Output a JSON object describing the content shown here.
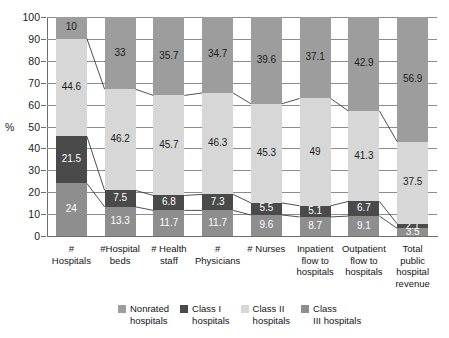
{
  "chart_data": {
    "type": "bar",
    "subtype": "stacked-100-percent",
    "title": "",
    "xlabel": "",
    "ylabel": "%",
    "ylim": [
      0,
      100
    ],
    "ytick_labels": [
      "0",
      "10",
      "20",
      "30",
      "40",
      "50",
      "60",
      "70",
      "80",
      "90",
      "100"
    ],
    "ytick_values": [
      0,
      10,
      20,
      30,
      40,
      50,
      60,
      70,
      80,
      90,
      100
    ],
    "grid": true,
    "legend_position": "bottom",
    "categories": [
      "# Hospitals",
      "#Hospital beds",
      "# Health staff",
      "# Physicians",
      "# Nurses",
      "Inpatient flow to hospitals",
      "Outpatient flow to hospitals",
      "Total public hospital revenue"
    ],
    "category_lines": [
      [
        "#",
        "Hospitals"
      ],
      [
        "#Hospital",
        "beds"
      ],
      [
        "# Health",
        "staff"
      ],
      [
        "#",
        "Physicians"
      ],
      [
        "# Nurses"
      ],
      [
        "Inpatient",
        "flow to",
        "hospitals"
      ],
      [
        "Outpatient",
        "flow to",
        "hospitals"
      ],
      [
        "Total",
        "public",
        "hospital",
        "revenue"
      ]
    ],
    "series": [
      {
        "name": "Class III hospitals",
        "color": "#8e8e8e",
        "label_color": "#ffffff",
        "values": [
          24,
          13.3,
          11.7,
          11.7,
          9.6,
          8.7,
          9.1,
          3.5
        ]
      },
      {
        "name": "Class I hospitals",
        "color": "#4a4a4a",
        "label_color": "#ffffff",
        "values": [
          21.5,
          7.5,
          6.8,
          7.3,
          5.5,
          5.1,
          6.7,
          2.1
        ]
      },
      {
        "name": "Class II hospitals",
        "color": "#d7d7d7",
        "label_color": "#1c1c1c",
        "values": [
          44.6,
          46.2,
          45.7,
          46.3,
          45.3,
          49,
          41.3,
          37.5
        ]
      },
      {
        "name": "Nonrated hospitals",
        "color": "#9d9d9d",
        "label_color": "#1c1c1c",
        "values": [
          10,
          33,
          35.7,
          34.7,
          39.6,
          37.1,
          42.9,
          56.9
        ]
      }
    ]
  },
  "legend": {
    "items": [
      {
        "label_line1": "Nonrated",
        "label_line2": "hospitals",
        "color": "#9d9d9d"
      },
      {
        "label_line1": "Class I",
        "label_line2": "hospitals",
        "color": "#4a4a4a"
      },
      {
        "label_line1": "Class II",
        "label_line2": "hospitals",
        "color": "#d7d7d7"
      },
      {
        "label_line1": "Class",
        "label_line2": "III hospitals",
        "color": "#8e8e8e"
      }
    ]
  },
  "axis": {
    "y_title": "%"
  }
}
